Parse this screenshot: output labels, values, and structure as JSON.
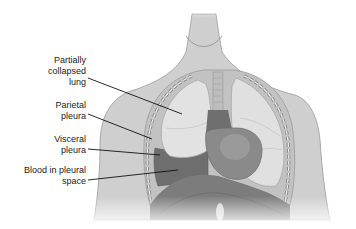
{
  "diagram": {
    "labels": [
      {
        "id": "partially-collapsed-lung",
        "text": "Partially\ncollapsed\nlung"
      },
      {
        "id": "parietal-pleura",
        "text": "Parietal\npleura"
      },
      {
        "id": "visceral-pleura",
        "text": "Visceral\npleura"
      },
      {
        "id": "blood-in-pleural-space",
        "text": "Blood in pleural\nspace"
      }
    ],
    "colors": {
      "skin": "#cfcfcf",
      "outline": "#9a9a9a",
      "lung": "#e0e0e0",
      "collapsed_lung": "#d6d6d6",
      "blood": "#6e6e6e",
      "heart": "#8a8a8a",
      "diaphragm": "#7c7c7c",
      "leader_line": "#111111"
    }
  }
}
